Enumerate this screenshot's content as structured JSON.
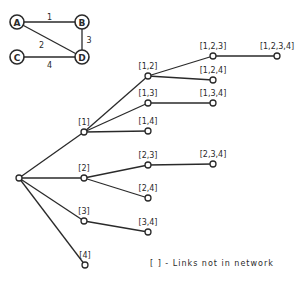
{
  "network": {
    "nodes": [
      {
        "id": "A",
        "label": "A",
        "x": 17,
        "y": 22
      },
      {
        "id": "B",
        "label": "B",
        "x": 82,
        "y": 22
      },
      {
        "id": "C",
        "label": "C",
        "x": 17,
        "y": 57
      },
      {
        "id": "D",
        "label": "D",
        "x": 82,
        "y": 57
      }
    ],
    "links": [
      {
        "from": "A",
        "to": "B",
        "label": "1"
      },
      {
        "from": "A",
        "to": "D",
        "label": "2"
      },
      {
        "from": "B",
        "to": "D",
        "label": "3"
      },
      {
        "from": "C",
        "to": "D",
        "label": "4"
      }
    ]
  },
  "tree": {
    "nodes": [
      {
        "id": "root",
        "label": "",
        "x": 19,
        "y": 178
      },
      {
        "id": "1",
        "label": "[1]",
        "x": 84,
        "y": 132
      },
      {
        "id": "2",
        "label": "[2]",
        "x": 84,
        "y": 178
      },
      {
        "id": "3",
        "label": "[3]",
        "x": 84,
        "y": 221
      },
      {
        "id": "4",
        "label": "[4]",
        "x": 85,
        "y": 265
      },
      {
        "id": "12",
        "label": "[1,2]",
        "x": 148,
        "y": 76
      },
      {
        "id": "13",
        "label": "[1,3]",
        "x": 148,
        "y": 103
      },
      {
        "id": "14",
        "label": "[1,4]",
        "x": 148,
        "y": 131
      },
      {
        "id": "23",
        "label": "[2,3]",
        "x": 148,
        "y": 165
      },
      {
        "id": "24",
        "label": "[2,4]",
        "x": 148,
        "y": 198
      },
      {
        "id": "34",
        "label": "[3,4]",
        "x": 148,
        "y": 232
      },
      {
        "id": "123",
        "label": "[1,2,3]",
        "x": 213,
        "y": 56
      },
      {
        "id": "124",
        "label": "[1,2,4]",
        "x": 213,
        "y": 80
      },
      {
        "id": "134",
        "label": "[1,3,4]",
        "x": 213,
        "y": 103
      },
      {
        "id": "234",
        "label": "[2,3,4]",
        "x": 213,
        "y": 164
      },
      {
        "id": "1234",
        "label": "[1,2,3,4]",
        "x": 277,
        "y": 56
      }
    ],
    "edges": [
      [
        "root",
        "1"
      ],
      [
        "root",
        "2"
      ],
      [
        "root",
        "3"
      ],
      [
        "root",
        "4"
      ],
      [
        "1",
        "12"
      ],
      [
        "1",
        "13"
      ],
      [
        "1",
        "14"
      ],
      [
        "2",
        "23"
      ],
      [
        "2",
        "24"
      ],
      [
        "3",
        "34"
      ],
      [
        "12",
        "123"
      ],
      [
        "12",
        "124"
      ],
      [
        "13",
        "134"
      ],
      [
        "23",
        "234"
      ],
      [
        "123",
        "1234"
      ]
    ]
  },
  "legend": {
    "text": "[  ] - Links not in network"
  }
}
